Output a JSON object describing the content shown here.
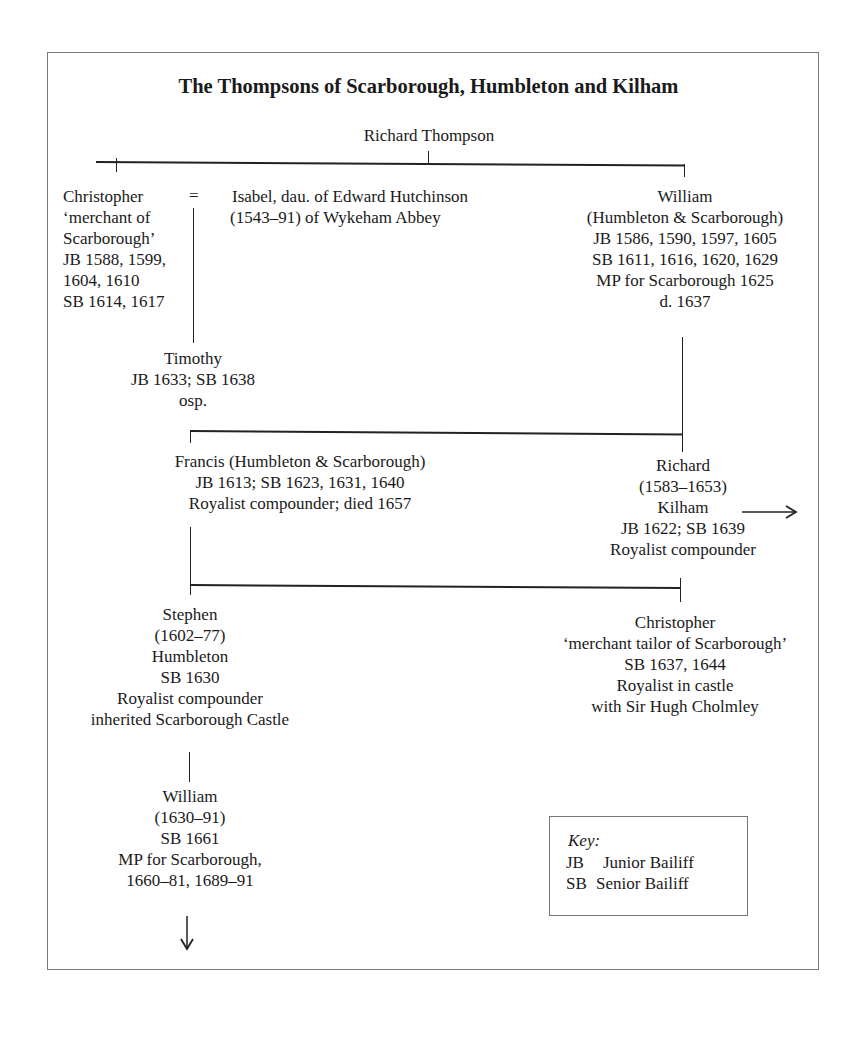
{
  "title": "The Thompsons of Scarborough, Humbleton and Kilham",
  "root": {
    "name": "Richard Thompson"
  },
  "marriage_symbol": "=",
  "people": {
    "christopher_elder": {
      "lines": [
        "Christopher",
        "‘merchant of",
        "Scarborough’",
        "JB 1588, 1599,",
        "1604, 1610",
        "SB 1614, 1617"
      ]
    },
    "isabel": {
      "lines": [
        "Isabel, dau. of Edward Hutchinson",
        "(1543–91) of Wykeham Abbey"
      ]
    },
    "william_elder": {
      "lines": [
        "William",
        "(Humbleton & Scarborough)",
        "JB 1586, 1590, 1597, 1605",
        "SB 1611, 1616, 1620, 1629",
        "MP for Scarborough 1625",
        "d. 1637"
      ]
    },
    "timothy": {
      "lines": [
        "Timothy",
        "JB 1633; SB 1638",
        "osp."
      ]
    },
    "francis": {
      "lines": [
        "Francis (Humbleton & Scarborough)",
        "JB 1613; SB 1623, 1631, 1640",
        "Royalist compounder; died 1657"
      ]
    },
    "richard_kilham": {
      "lines": [
        "Richard",
        "(1583–1653)",
        "Kilham",
        "JB 1622; SB 1639",
        "Royalist compounder"
      ]
    },
    "stephen": {
      "lines": [
        "Stephen",
        "(1602–77)",
        "Humbleton",
        "SB 1630",
        "Royalist compounder",
        "inherited Scarborough Castle"
      ]
    },
    "christopher_younger": {
      "lines": [
        "Christopher",
        "‘merchant tailor of Scarborough’",
        "SB 1637, 1644",
        "Royalist in castle",
        "with Sir Hugh Cholmley"
      ]
    },
    "william_younger": {
      "lines": [
        "William",
        "(1630–91)",
        "SB 1661",
        "MP for Scarborough,",
        "1660–81, 1689–91"
      ]
    }
  },
  "key": {
    "heading": "Key:",
    "entries": [
      {
        "abbr": "JB",
        "meaning": "Junior Bailiff"
      },
      {
        "abbr": "SB",
        "meaning": "Senior Bailiff"
      }
    ]
  },
  "icons": {
    "continuation_right": "arrow-right-icon",
    "continuation_down": "arrow-down-icon"
  }
}
